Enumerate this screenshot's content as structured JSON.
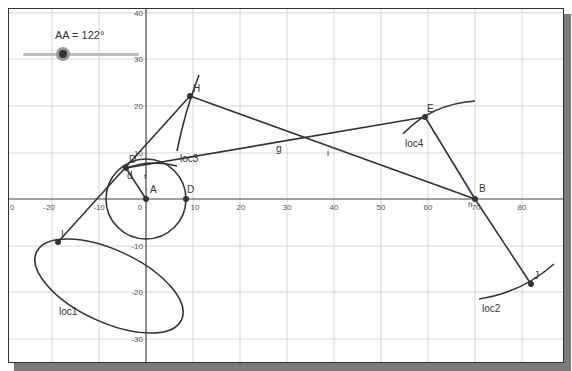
{
  "slider": {
    "label": "AA = 122°",
    "name": "AA",
    "value_deg": 122
  },
  "axes": {
    "x_ticks": [
      "0",
      "-20",
      "-10",
      "0",
      "10",
      "20",
      "30",
      "40",
      "50",
      "60",
      "70",
      "80"
    ],
    "x_tick_values": [
      -30,
      -20,
      -10,
      0,
      10,
      20,
      30,
      40,
      50,
      60,
      70,
      80
    ],
    "x_tick_labels": [
      "0",
      "-20",
      "-10",
      "0",
      "10",
      "20",
      "30",
      "40",
      "50",
      "60",
      "70",
      "80"
    ],
    "y_tick_values": [
      40,
      30,
      20,
      10,
      -10,
      -20,
      -30
    ],
    "y_tick_labels": [
      "40",
      "30",
      "20",
      "10",
      "-10",
      "-20",
      "-30"
    ],
    "grid": true
  },
  "points": {
    "A": {
      "label": "A",
      "x": 0,
      "y": 0
    },
    "D": {
      "label": "D",
      "x": 8.5,
      "y": 0
    },
    "D2": {
      "label": "D",
      "x": -4.3,
      "y": 6.7
    },
    "H": {
      "label": "H",
      "x": 9.4,
      "y": 22.2
    },
    "E": {
      "label": "E",
      "x": 59.4,
      "y": 17.6
    },
    "B": {
      "label": "B",
      "x": 70,
      "y": 0
    },
    "J": {
      "label": "J",
      "x": 82,
      "y": -18.3
    },
    "I": {
      "label": "I",
      "x": -18.7,
      "y": -9.2
    }
  },
  "labels": {
    "d": "d",
    "f": "f",
    "g": "g",
    "i": "i",
    "h": "h",
    "loc1": "loc1",
    "loc2": "loc2",
    "loc3": "loc3",
    "loc4": "loc4",
    "b_small": "h"
  },
  "colors": {
    "line": "#333333",
    "grid": "#d6d6d6",
    "axis": "#444444",
    "point": "#333333",
    "shadow": "#7a7a7a"
  }
}
